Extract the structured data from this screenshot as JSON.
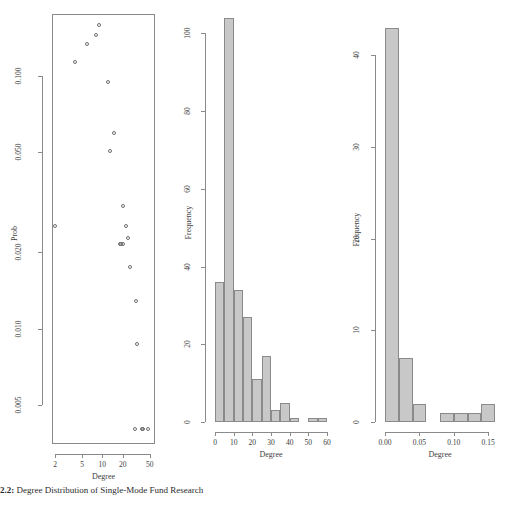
{
  "figure": {
    "caption_label": "2.2:",
    "caption_text": "Degree Distribution of Single-Mode Fund Research"
  },
  "chart_data": [
    {
      "type": "scatter",
      "panel": "left",
      "title": "",
      "xlabel": "Degree",
      "ylabel": "Prob",
      "xscale": "log",
      "yscale": "log",
      "xlim": [
        1.8,
        60
      ],
      "ylim": [
        0.0035,
        0.175
      ],
      "xticks": [
        2,
        5,
        10,
        20,
        50
      ],
      "xticklabels": [
        "2",
        "5",
        "10",
        "20",
        "50"
      ],
      "yticks": [
        0.005,
        0.01,
        0.02,
        0.05,
        0.1
      ],
      "yticklabels": [
        "0.005",
        "0.010",
        "0.020",
        "0.050",
        "0.100"
      ],
      "grid": false,
      "legend": "none",
      "marker": "open-circle",
      "points": [
        {
          "x": 2,
          "y": 0.0255
        },
        {
          "x": 4,
          "y": 0.113
        },
        {
          "x": 6,
          "y": 0.133
        },
        {
          "x": 8,
          "y": 0.145
        },
        {
          "x": 9,
          "y": 0.158
        },
        {
          "x": 12,
          "y": 0.094
        },
        {
          "x": 13,
          "y": 0.0505
        },
        {
          "x": 15,
          "y": 0.0595
        },
        {
          "x": 18,
          "y": 0.0215
        },
        {
          "x": 19,
          "y": 0.0215
        },
        {
          "x": 20,
          "y": 0.0215
        },
        {
          "x": 20,
          "y": 0.0305
        },
        {
          "x": 22,
          "y": 0.0255
        },
        {
          "x": 24,
          "y": 0.0228
        },
        {
          "x": 26,
          "y": 0.0175
        },
        {
          "x": 31,
          "y": 0.0128
        },
        {
          "x": 33,
          "y": 0.0087
        },
        {
          "x": 30,
          "y": 0.004
        },
        {
          "x": 38,
          "y": 0.004
        },
        {
          "x": 40,
          "y": 0.004
        },
        {
          "x": 47,
          "y": 0.004
        }
      ]
    },
    {
      "type": "bar",
      "panel": "middle",
      "title": "",
      "xlabel": "Degree",
      "ylabel": "Frequency",
      "xlim": [
        0,
        60
      ],
      "ylim": [
        0,
        105
      ],
      "xticks": [
        0,
        10,
        20,
        30,
        40,
        50,
        60
      ],
      "xticklabels": [
        "0",
        "10",
        "20",
        "30",
        "40",
        "50",
        "60"
      ],
      "yticks": [
        0,
        20,
        40,
        60,
        80,
        100
      ],
      "yticklabels": [
        "0",
        "20",
        "40",
        "60",
        "80",
        "100"
      ],
      "grid": false,
      "legend": "none",
      "binwidth": 5,
      "bins": [
        {
          "start": 0,
          "end": 5,
          "value": 36
        },
        {
          "start": 5,
          "end": 10,
          "value": 104
        },
        {
          "start": 10,
          "end": 15,
          "value": 34
        },
        {
          "start": 15,
          "end": 20,
          "value": 27
        },
        {
          "start": 20,
          "end": 25,
          "value": 11
        },
        {
          "start": 25,
          "end": 30,
          "value": 17
        },
        {
          "start": 30,
          "end": 35,
          "value": 3
        },
        {
          "start": 35,
          "end": 40,
          "value": 5
        },
        {
          "start": 40,
          "end": 45,
          "value": 1
        },
        {
          "start": 45,
          "end": 50,
          "value": 0
        },
        {
          "start": 50,
          "end": 55,
          "value": 1
        },
        {
          "start": 55,
          "end": 60,
          "value": 1
        }
      ]
    },
    {
      "type": "bar",
      "panel": "right",
      "title": "",
      "xlabel": "Degree",
      "ylabel": "Frequency",
      "xlim": [
        0.0,
        0.16
      ],
      "ylim": [
        0,
        43
      ],
      "xticks": [
        0.0,
        0.05,
        0.1,
        0.15
      ],
      "xticklabels": [
        "0.00",
        "0.05",
        "0.10",
        "0.15"
      ],
      "yticks": [
        0,
        10,
        20,
        30,
        40
      ],
      "yticklabels": [
        "0",
        "10",
        "20",
        "30",
        "40"
      ],
      "grid": false,
      "legend": "none",
      "binwidth": 0.02,
      "bins": [
        {
          "start": 0.0,
          "end": 0.02,
          "value": 43
        },
        {
          "start": 0.02,
          "end": 0.04,
          "value": 7
        },
        {
          "start": 0.04,
          "end": 0.06,
          "value": 2
        },
        {
          "start": 0.06,
          "end": 0.08,
          "value": 0
        },
        {
          "start": 0.08,
          "end": 0.1,
          "value": 1
        },
        {
          "start": 0.1,
          "end": 0.12,
          "value": 1
        },
        {
          "start": 0.12,
          "end": 0.14,
          "value": 1
        },
        {
          "start": 0.14,
          "end": 0.16,
          "value": 2
        }
      ]
    }
  ]
}
